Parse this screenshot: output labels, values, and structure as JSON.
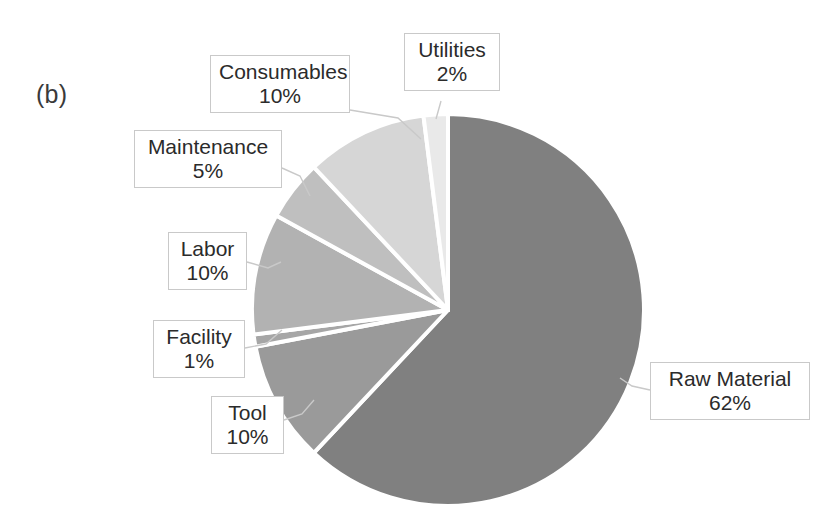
{
  "panel": {
    "letter": "(b)"
  },
  "chart_data": {
    "type": "pie",
    "title": "",
    "subtitle": "",
    "xlabel": "",
    "ylabel": "",
    "legend_position": "none",
    "grid": false,
    "units": "percent",
    "total": 100,
    "labels": [
      "Raw Material",
      "Consumables",
      "Tool",
      "Labor",
      "Maintenance",
      "Utilities",
      "Facility"
    ],
    "values": [
      62,
      10,
      10,
      10,
      5,
      2,
      1
    ],
    "slices": [
      {
        "label": "Raw Material",
        "value": 62,
        "value_text": "62%",
        "color": "#808080",
        "start_angle": 0,
        "sweep": 223.2
      },
      {
        "label": "Tool",
        "value": 10,
        "value_text": "10%",
        "color": "#9a9a9a",
        "start_angle": 223.2,
        "sweep": 36.0
      },
      {
        "label": "Facility",
        "value": 1,
        "value_text": "1%",
        "color": "#a6a6a6",
        "start_angle": 259.2,
        "sweep": 3.6
      },
      {
        "label": "Labor",
        "value": 10,
        "value_text": "10%",
        "color": "#b2b2b2",
        "start_angle": 262.8,
        "sweep": 36.0
      },
      {
        "label": "Maintenance",
        "value": 5,
        "value_text": "5%",
        "color": "#bfbfbf",
        "start_angle": 298.8,
        "sweep": 18.0
      },
      {
        "label": "Consumables",
        "value": 10,
        "value_text": "10%",
        "color": "#d6d6d6",
        "start_angle": 316.8,
        "sweep": 36.0
      },
      {
        "label": "Utilities",
        "value": 2,
        "value_text": "2%",
        "color": "#e9e9e9",
        "start_angle": 352.8,
        "sweep": 7.2
      }
    ],
    "separator_color": "#ffffff",
    "background_color": "#ffffff"
  },
  "callouts": {
    "raw_material": {
      "name": "Raw Material",
      "value": "62%"
    },
    "consumables": {
      "name": "Consumables",
      "value": "10%"
    },
    "tool": {
      "name": "Tool",
      "value": "10%"
    },
    "labor": {
      "name": "Labor",
      "value": "10%"
    },
    "maintenance": {
      "name": "Maintenance",
      "value": "5%"
    },
    "utilities": {
      "name": "Utilities",
      "value": "2%"
    },
    "facility": {
      "name": "Facility",
      "value": "1%"
    }
  }
}
